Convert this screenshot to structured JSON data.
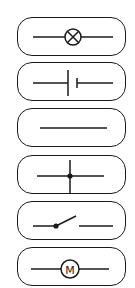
{
  "palette": {
    "items": [
      {
        "id": "lamp",
        "label": "Lamp",
        "icon": "lamp-icon",
        "top": 17
      },
      {
        "id": "battery",
        "label": "Battery",
        "icon": "battery-icon",
        "top": 62
      },
      {
        "id": "wire",
        "label": "Wire",
        "icon": "wire-icon",
        "top": 108
      },
      {
        "id": "junction",
        "label": "Junction",
        "icon": "junction-icon",
        "top": 155
      },
      {
        "id": "switch",
        "label": "Switch",
        "icon": "switch-icon",
        "top": 201
      },
      {
        "id": "motor",
        "label": "Motor",
        "icon": "motor-icon",
        "top": 247
      }
    ],
    "motor_symbol_text": "M"
  },
  "colors": {
    "stroke": "#1a1a1a",
    "background": "#ffffff"
  }
}
